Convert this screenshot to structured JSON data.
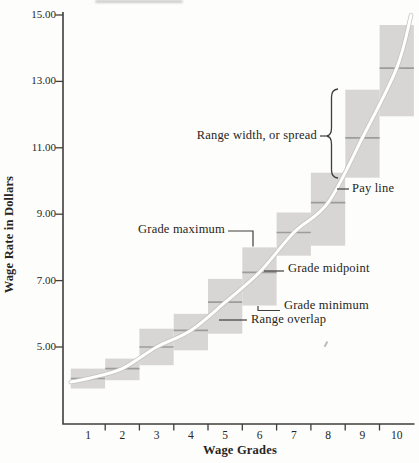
{
  "chart_data": {
    "type": "bar",
    "subtype": "wage-structure figure: floating grade-range boxes with midpoint dashes and a smooth pay-line curve",
    "title": "",
    "xlabel": "Wage Grades",
    "ylabel": "Wage Rate in Dollars",
    "x_tick_labels": [
      "1",
      "2",
      "3",
      "4",
      "5",
      "6",
      "7",
      "8",
      "9",
      "10"
    ],
    "y_tick_labels": [
      "15.00",
      "13.00",
      "11.00",
      "9.00",
      "7.00",
      "5.00"
    ],
    "y_tick_values": [
      15.0,
      13.0,
      11.0,
      9.0,
      7.0,
      5.0
    ],
    "ylim": [
      3.2,
      15.35
    ],
    "xlim_grades": [
      0.5,
      10.75
    ],
    "grid": false,
    "legend_position": "none (labels drawn as callout annotations)",
    "grades": [
      {
        "grade": 1,
        "min": 3.75,
        "mid": 4.05,
        "max": 4.35
      },
      {
        "grade": 2,
        "min": 4.0,
        "mid": 4.35,
        "max": 4.65
      },
      {
        "grade": 3,
        "min": 4.45,
        "mid": 5.0,
        "max": 5.55
      },
      {
        "grade": 4,
        "min": 4.9,
        "mid": 5.5,
        "max": 6.0
      },
      {
        "grade": 5,
        "min": 5.4,
        "mid": 6.35,
        "max": 7.05
      },
      {
        "grade": 6,
        "min": 6.25,
        "mid": 7.25,
        "max": 8.0
      },
      {
        "grade": 7,
        "min": 7.75,
        "mid": 8.45,
        "max": 9.05
      },
      {
        "grade": 8,
        "min": 8.05,
        "mid": 9.35,
        "max": 10.25
      },
      {
        "grade": 9,
        "min": 10.1,
        "mid": 11.3,
        "max": 12.75
      },
      {
        "grade": 10,
        "min": 11.95,
        "mid": 13.4,
        "max": 14.7
      }
    ],
    "pay_line": {
      "label": "Pay line",
      "x_grades": [
        1,
        2,
        3,
        4,
        5,
        6,
        7,
        8,
        9,
        10
      ],
      "y_values": [
        4.05,
        4.35,
        5.0,
        5.5,
        6.35,
        7.25,
        8.45,
        9.35,
        11.3,
        13.4
      ]
    },
    "annotations": {
      "range_width": "Range width, or spread",
      "pay_line": "Pay line",
      "grade_maximum": "Grade maximum",
      "grade_midpoint": "Grade midpoint",
      "grade_minimum": "Grade minimum",
      "range_overlap": "Range overlap"
    },
    "annotation_targets": {
      "range_width": "full height of grade 9 range box (brace)",
      "pay_line": "white curve where it crosses near grade 8",
      "grade_maximum": "top edge of grade 6 box",
      "grade_midpoint": "midpoint dash of grade 6 box",
      "grade_minimum": "bottom edge of grade 6 box",
      "range_overlap": "overlap zone inside grade 5 box"
    },
    "colors": {
      "background": "#fdfdfb",
      "range_box_fill": "#d7d6d4",
      "midpoint_line": "#9c9c9a",
      "pay_line": "#ffffff",
      "pay_line_edge": "#c2c1bd",
      "axis_and_callouts": "#403e3b",
      "text": "#262522"
    }
  }
}
